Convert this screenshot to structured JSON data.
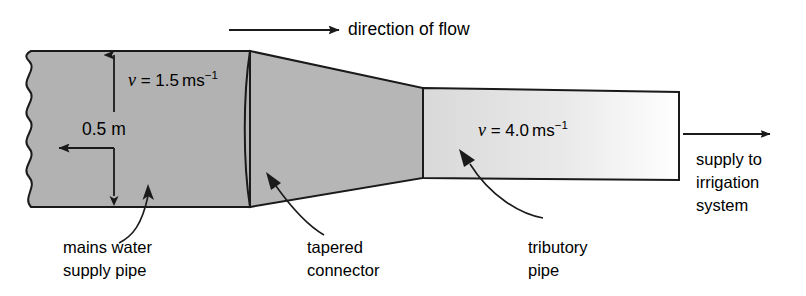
{
  "figure": {
    "type": "physics-fluid-flow-pipe-diagram",
    "background_color": "#ffffff",
    "line_color": "#1a1a1a"
  },
  "flow": {
    "arrow_label": "direction of flow",
    "arrow_name": "direction-of-flow-arrow"
  },
  "dimension": {
    "diameter_label": "0.5 m",
    "diameter_value": 0.5,
    "diameter_unit": "m"
  },
  "velocities": {
    "mains": {
      "symbol": "v",
      "equals": "=",
      "value": "1.5",
      "unit": "ms",
      "exponent": "−1",
      "full": "v = 1.5 ms⁻¹"
    },
    "tributary": {
      "symbol": "v",
      "equals": "=",
      "value": "4.0",
      "unit": "ms",
      "exponent": "−1",
      "full": "v = 4.0 ms⁻¹"
    }
  },
  "parts": [
    {
      "id": "mains",
      "label_line1": "mains water",
      "label_line2": "supply pipe",
      "fill_color": "#b2b2b2"
    },
    {
      "id": "connector",
      "label_line1": "tapered",
      "label_line2": "connector",
      "fill_color": "#b6b6b6"
    },
    {
      "id": "tributary",
      "label_line1": "tributory",
      "label_line2": "pipe",
      "fill_color": "#d9d9d9",
      "fill_color_end": "#ffffff"
    }
  ],
  "outlet": {
    "label_line1": "supply to",
    "label_line2": "irrigation",
    "label_line3": "system"
  }
}
